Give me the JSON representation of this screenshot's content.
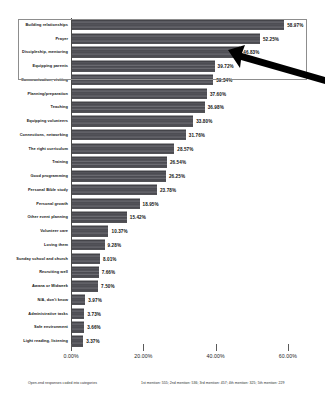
{
  "chart_data": {
    "type": "bar",
    "orientation": "horizontal",
    "title": "",
    "xlabel": "",
    "ylabel": "",
    "xlim": [
      0,
      66
    ],
    "grid": false,
    "legend": null,
    "xticks": [
      "0.00%",
      "20.00%",
      "40.00%",
      "60.00%"
    ],
    "xtick_values": [
      0,
      20,
      40,
      60
    ],
    "categories": [
      "Building relationships",
      "Prayer",
      "Discipleship, mentoring",
      "Equipping parents",
      "Communication, visiting",
      "Planning/preparation",
      "Teaching",
      "Equipping volunteers",
      "Connections, networking",
      "The right curriculum",
      "Training",
      "Good programming",
      "Personal Bible study",
      "Personal growth",
      "Other event planning",
      "Volunteer care",
      "Loving them",
      "Sunday school and church",
      "Recruiting well",
      "Awana or Midweek",
      "N/A, don't know",
      "Administrative tasks",
      "Safe environment",
      "Light reading, listening"
    ],
    "values": [
      58.97,
      52.25,
      46.83,
      39.72,
      39.34,
      37.6,
      36.98,
      33.8,
      31.76,
      28.57,
      26.54,
      26.25,
      23.78,
      18.95,
      15.42,
      10.37,
      9.28,
      8.01,
      7.66,
      7.5,
      3.97,
      3.73,
      3.66,
      3.37
    ],
    "value_labels": [
      "58.97%",
      "52.25%",
      "46.83%",
      "39.72%",
      "39.34%",
      "37.60%",
      "36.98%",
      "33.80%",
      "31.76%",
      "28.57%",
      "26.54%",
      "26.25%",
      "23.78%",
      "18.95%",
      "15.42%",
      "10.37%",
      "9.28%",
      "8.01%",
      "7.66%",
      "7.50%",
      "3.97%",
      "3.73%",
      "3.66%",
      "3.37%"
    ],
    "bar_color": "#58585e"
  },
  "annotation": {
    "highlight_label": "highlight-box-top-four",
    "highlighted_categories": [
      "Building relationships",
      "Prayer",
      "Discipleship, mentoring",
      "Equipping parents"
    ],
    "arrow_color": "#000000"
  },
  "footnotes": {
    "left": "Open-end responses coded into categories",
    "right": "1st mention: 555; 2nd mention: 536; 3rd mention: 457; 4th mention: 325; 5th mention: 229"
  }
}
